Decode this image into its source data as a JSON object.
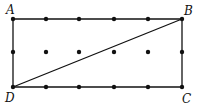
{
  "diagram": {
    "type": "lattice-rectangle",
    "labels": {
      "A": "A",
      "B": "B",
      "C": "C",
      "D": "D"
    },
    "grid": {
      "columns": 6,
      "rows": 3,
      "x": [
        13,
        46,
        79,
        114,
        148,
        182
      ],
      "y": [
        19,
        52,
        87
      ]
    },
    "vertices": {
      "A": [
        13,
        19
      ],
      "B": [
        182,
        19
      ],
      "C": [
        182,
        87
      ],
      "D": [
        13,
        87
      ]
    },
    "segments": [
      [
        "A",
        "B"
      ],
      [
        "B",
        "C"
      ],
      [
        "C",
        "D"
      ],
      [
        "D",
        "A"
      ],
      [
        "D",
        "B"
      ]
    ],
    "colors": {
      "line": "#111111",
      "dot": "#111111",
      "background": "#ffffff"
    }
  }
}
